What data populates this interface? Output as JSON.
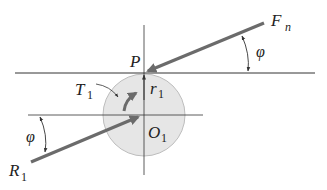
{
  "diagram": {
    "colors": {
      "background": "#ffffff",
      "thin_line": "#333333",
      "force_arrow": "#6b6b6b",
      "gear_fill": "#e6e6e6",
      "gear_stroke": "#bdbdbd",
      "text": "#222222"
    },
    "labels": {
      "pitch_point": "P",
      "normal_force_main": "F",
      "normal_force_sub": "n",
      "reaction_main": "R",
      "reaction_sub": "1",
      "torque_main": "T",
      "torque_sub": "1",
      "radius_main": "r",
      "radius_sub": "1",
      "center_main": "O",
      "center_sub": "1",
      "angle_upper": "φ",
      "angle_lower": "φ"
    },
    "geometry": {
      "pitch_point": [
        144,
        73
      ],
      "gear_center": [
        144,
        115
      ],
      "gear_radius": 41,
      "pitch_line": {
        "x1": 15,
        "x2": 315,
        "y": 73
      },
      "center_line_h": {
        "x1": 28,
        "x2": 203,
        "y": 115
      },
      "center_line_v": {
        "x": 144,
        "y1": 25,
        "y2": 175
      },
      "normal_force": {
        "from": [
          264,
          23
        ],
        "to": [
          146,
          72
        ]
      },
      "reaction_force": {
        "from": [
          31,
          162
        ],
        "to": [
          140,
          116
        ]
      }
    }
  }
}
